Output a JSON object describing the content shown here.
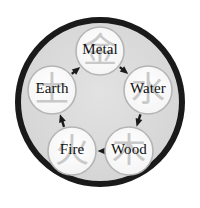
{
  "diagram": {
    "outer_ring": {
      "name": "outer-ring",
      "cx": 100,
      "cy": 102,
      "r": 82,
      "stroke_color": "#1a1a1a",
      "stroke_width": 6,
      "fill_color": "#dcdcdc"
    },
    "node_style": {
      "radius": 24,
      "fill_color": "#fbfbfb",
      "stroke_color": "#b5b5b5",
      "stroke_width": 1.6,
      "label_color": "#111111",
      "glyph_color": "#c9c9c9"
    },
    "arrow_style": {
      "color": "#1a1a1a",
      "stroke_width": 2.4,
      "head_length": 8,
      "head_width": 7
    },
    "nodes": [
      {
        "id": "metal",
        "label": "Metal",
        "glyph": "金",
        "glyph_name": "metal-chinese-character",
        "cx": 100,
        "cy": 51
      },
      {
        "id": "water",
        "label": "Water",
        "glyph": "水",
        "glyph_name": "water-chinese-character",
        "cx": 148,
        "cy": 90
      },
      {
        "id": "wood",
        "label": "Wood",
        "glyph": "木",
        "glyph_name": "wood-chinese-character",
        "cx": 129,
        "cy": 151
      },
      {
        "id": "fire",
        "label": "Fire",
        "glyph": "火",
        "glyph_name": "fire-chinese-character",
        "cx": 72,
        "cy": 151
      },
      {
        "id": "earth",
        "label": "Earth",
        "glyph": "土",
        "glyph_name": "earth-chinese-character",
        "cx": 52,
        "cy": 90
      }
    ],
    "arrows": [
      {
        "id": "metal-to-water",
        "from": "metal",
        "to": "water",
        "from_label": "Metal",
        "to_label": "Water"
      },
      {
        "id": "water-to-wood",
        "from": "water",
        "to": "wood",
        "from_label": "Water",
        "to_label": "Wood"
      },
      {
        "id": "wood-to-fire",
        "from": "wood",
        "to": "fire",
        "from_label": "Wood",
        "to_label": "Fire"
      },
      {
        "id": "fire-to-earth",
        "from": "fire",
        "to": "earth",
        "from_label": "Fire",
        "to_label": "Earth"
      },
      {
        "id": "earth-to-metal",
        "from": "earth",
        "to": "metal",
        "from_label": "Earth",
        "to_label": "Metal"
      }
    ]
  }
}
